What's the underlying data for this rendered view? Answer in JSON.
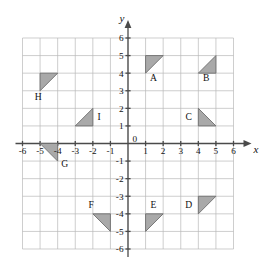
{
  "chart_data": {
    "type": "scatter",
    "title": "",
    "xlabel": "x",
    "ylabel": "y",
    "xlim": [
      -6,
      6
    ],
    "ylim": [
      -6,
      6
    ],
    "grid": true,
    "legend": "none",
    "x_ticks": [
      "-6",
      "-5",
      "-4",
      "-3",
      "-2",
      "-1",
      "0",
      "1",
      "2",
      "3",
      "4",
      "5",
      "6"
    ],
    "y_ticks": [
      "6",
      "5",
      "4",
      "3",
      "2",
      "1",
      "0",
      "-1",
      "-2",
      "-3",
      "-4",
      "-5",
      "-6"
    ],
    "origin_label": "0",
    "shapes": [
      {
        "label": "A",
        "vertices": [
          [
            1,
            5
          ],
          [
            2,
            5
          ],
          [
            1,
            4
          ]
        ],
        "label_at": [
          1.45,
          3.55
        ]
      },
      {
        "label": "B",
        "vertices": [
          [
            4,
            4
          ],
          [
            5,
            5
          ],
          [
            5,
            4
          ]
        ],
        "label_at": [
          4.45,
          3.55
        ]
      },
      {
        "label": "C",
        "vertices": [
          [
            4,
            2
          ],
          [
            5,
            1
          ],
          [
            4,
            1
          ]
        ],
        "label_at": [
          3.45,
          1.35
        ]
      },
      {
        "label": "D",
        "vertices": [
          [
            4,
            -3
          ],
          [
            5,
            -3
          ],
          [
            4,
            -4
          ]
        ],
        "label_at": [
          3.45,
          -3.65
        ]
      },
      {
        "label": "E",
        "vertices": [
          [
            1,
            -4
          ],
          [
            2,
            -4
          ],
          [
            1,
            -5
          ]
        ],
        "label_at": [
          1.45,
          -3.65
        ]
      },
      {
        "label": "F",
        "vertices": [
          [
            -2,
            -4
          ],
          [
            -1,
            -4
          ],
          [
            -1,
            -5
          ]
        ],
        "label_at": [
          -2.1,
          -3.65
        ]
      },
      {
        "label": "G",
        "vertices": [
          [
            -5,
            0
          ],
          [
            -4,
            0
          ],
          [
            -4,
            -1
          ]
        ],
        "label_at": [
          -3.6,
          -1.35
        ]
      },
      {
        "label": "H",
        "vertices": [
          [
            -5,
            4
          ],
          [
            -4,
            4
          ],
          [
            -5,
            3
          ]
        ],
        "label_at": [
          -5.1,
          2.5
        ]
      },
      {
        "label": "I",
        "vertices": [
          [
            -3,
            1
          ],
          [
            -2,
            1
          ],
          [
            -2,
            2
          ]
        ],
        "label_at": [
          -1.65,
          1.35
        ]
      }
    ]
  },
  "axes": {
    "x_axis_name": "x",
    "y_axis_name": "y"
  },
  "colors": {
    "shape_fill": "#a9a9a9",
    "shape_stroke": "#6e6e6e",
    "gridline": "#b9b9b9",
    "axis": "#4a4a4a",
    "text": "#111111",
    "background": "#ffffff"
  }
}
